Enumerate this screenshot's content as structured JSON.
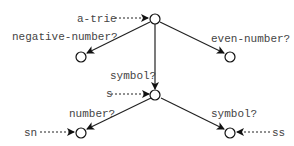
{
  "diagram": {
    "type": "trie",
    "nodes": [
      {
        "id": "root",
        "x": 155,
        "y": 19
      },
      {
        "id": "neg",
        "x": 81,
        "y": 57
      },
      {
        "id": "even",
        "x": 230,
        "y": 57
      },
      {
        "id": "s",
        "x": 156,
        "y": 95
      },
      {
        "id": "sn",
        "x": 81,
        "y": 133
      },
      {
        "id": "ss",
        "x": 230,
        "y": 133
      }
    ],
    "edges": [
      {
        "from": "root",
        "to": "neg",
        "label": "negative-number?"
      },
      {
        "from": "root",
        "to": "even",
        "label": "even-number?"
      },
      {
        "from": "root",
        "to": "s",
        "label": "symbol?"
      },
      {
        "from": "s",
        "to": "sn",
        "label": "number?"
      },
      {
        "from": "s",
        "to": "ss",
        "label": "symbol?"
      }
    ],
    "pointers": [
      {
        "label": "a-trie",
        "target": "root"
      },
      {
        "label": "s",
        "target": "s"
      },
      {
        "label": "sn",
        "target": "sn"
      },
      {
        "label": "ss",
        "target": "ss"
      }
    ]
  },
  "labels": {
    "a_trie": "a-trie",
    "negative_number": "negative-number?",
    "even_number": "even-number?",
    "symbol_1": "symbol?",
    "s": "s",
    "number": "number?",
    "symbol_2": "symbol?",
    "sn": "sn",
    "ss": "ss"
  }
}
